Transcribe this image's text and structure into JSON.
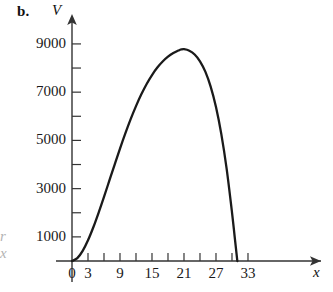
{
  "figure": {
    "panel_label": "b.",
    "vertical_axis_name": "V",
    "horizontal_axis_name": "x",
    "edge_artifact_text": "r\nx",
    "curve_color": "#1a1a1a",
    "axis_color": "#333333",
    "background_color": "#ffffff"
  },
  "chart_data": {
    "type": "line",
    "title": "",
    "subtitle": "",
    "xlabel": "x",
    "ylabel": "V",
    "grid": false,
    "legend": null,
    "xlim": [
      -1.5,
      35.5
    ],
    "ylim": [
      0,
      9600
    ],
    "x_ticks_major": [
      0,
      3,
      9,
      15,
      21,
      27,
      33
    ],
    "x_ticks_minor": [
      6,
      12,
      18,
      24,
      30
    ],
    "x_tick_labels": [
      "0",
      "3",
      "9",
      "15",
      "21",
      "27",
      "33"
    ],
    "y_ticks_major": [
      1000,
      3000,
      5000,
      7000,
      9000
    ],
    "y_ticks_minor": [
      2000,
      4000,
      6000,
      8000
    ],
    "y_tick_labels": [
      "1000",
      "3000",
      "5000",
      "7000",
      "9000"
    ],
    "axis_arrows": [
      "up",
      "right"
    ],
    "series": [
      {
        "name": "V(x)",
        "color": "#1a1a1a",
        "x": [
          0,
          1,
          2,
          3,
          4,
          5,
          6,
          7,
          8,
          9,
          10,
          11,
          12,
          13,
          14,
          15,
          16,
          17,
          18,
          19,
          20,
          20.5,
          21,
          22,
          23,
          24,
          25,
          26,
          27,
          28,
          29,
          30,
          30.5,
          31
        ],
        "values": [
          0,
          120,
          420,
          860,
          1400,
          2010,
          2660,
          3330,
          4000,
          4660,
          5290,
          5880,
          6420,
          6910,
          7340,
          7710,
          8020,
          8270,
          8470,
          8620,
          8730,
          8770,
          8780,
          8720,
          8560,
          8280,
          7850,
          7230,
          6380,
          5260,
          3820,
          2020,
          1010,
          0
        ]
      }
    ],
    "annotations": {
      "peak_x": 21,
      "peak_value": 8780,
      "right_root_x": 31,
      "left_root_x": 0
    }
  }
}
